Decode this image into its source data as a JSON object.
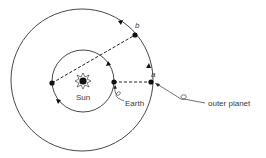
{
  "diagram": {
    "type": "orbital-geometry",
    "colors": {
      "ink": "#222222",
      "background": "#ffffff"
    },
    "sun": {
      "label": "Sun",
      "x": 83,
      "y": 81
    },
    "inner_orbit": {
      "name": "Earth orbit",
      "cx": 83,
      "cy": 81,
      "r": 31
    },
    "outer_orbit": {
      "name": "outer planet orbit",
      "cx": 82,
      "cy": 80,
      "r": 71
    },
    "points": [
      {
        "id": "earth-a",
        "x": 114,
        "y": 82
      },
      {
        "id": "earth-b",
        "x": 52,
        "y": 83
      },
      {
        "id": "planet-a",
        "label": "a",
        "x": 151,
        "y": 82
      },
      {
        "id": "planet-b",
        "label": "b",
        "x": 135,
        "y": 35
      }
    ],
    "lines": [
      {
        "from": "earth-a",
        "to": "planet-a",
        "style": "dashed"
      },
      {
        "from": "earth-b",
        "to": "planet-b",
        "style": "dashed"
      }
    ],
    "labels": {
      "sun": "Sun",
      "earth": "Earth",
      "outer_planet": "outer planet",
      "point_a": "a",
      "point_b": "b"
    }
  }
}
